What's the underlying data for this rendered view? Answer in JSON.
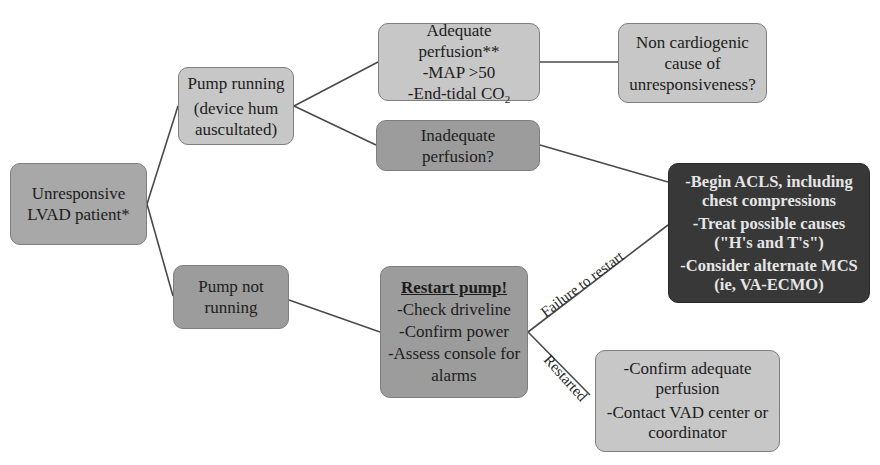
{
  "diagram": {
    "type": "flowchart",
    "nodes": {
      "start": {
        "lines": [
          "Unresponsive",
          "LVAD patient*"
        ]
      },
      "pump_running": {
        "lines": [
          "Pump running",
          "(device hum",
          "auscultated)"
        ]
      },
      "adequate": {
        "title": "Adequate perfusion**",
        "items": [
          "-MAP >50",
          "-End-tidal CO"
        ],
        "co2_sub": "2"
      },
      "non_cardiogenic": {
        "lines": [
          "Non cardiogenic",
          "cause of",
          "unresponsiveness?"
        ]
      },
      "inadequate": {
        "lines": [
          "Inadequate perfusion?"
        ]
      },
      "acls": {
        "items": [
          [
            "-Begin ACLS, including",
            "chest compressions"
          ],
          [
            "-Treat possible causes",
            "(\"H's and T's\")"
          ],
          [
            "-Consider alternate MCS",
            "(ie, VA-ECMO)"
          ]
        ]
      },
      "pump_not_running": {
        "lines": [
          "Pump not",
          "running"
        ]
      },
      "restart": {
        "title": "Restart pump!",
        "items": [
          "-Check driveline",
          "-Confirm power",
          "-Assess console for",
          "alarms"
        ]
      },
      "restarted_box": {
        "items": [
          [
            "-Confirm adequate",
            "perfusion"
          ],
          [
            "-Contact VAD center or",
            "coordinator"
          ]
        ]
      }
    },
    "edge_labels": {
      "failure": "Failure to restart",
      "restarted": "Restarted"
    },
    "colors": {
      "light": "#c7c7c7",
      "mid": "#9c9c9c",
      "base": "#a8a8a8",
      "dark": "#383838",
      "line": "#4a4a4a"
    }
  }
}
